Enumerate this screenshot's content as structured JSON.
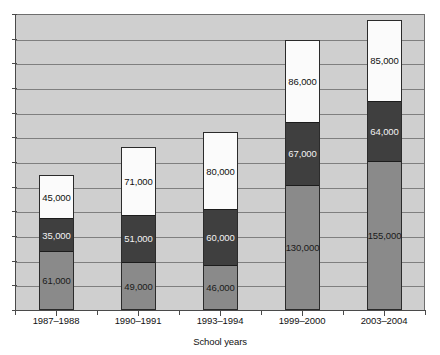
{
  "chart_data": {
    "type": "bar",
    "title": "",
    "xlabel": "School years",
    "ylabel": "",
    "grid": true,
    "legend": "none",
    "stacked": true,
    "categories": [
      "1987–1988",
      "1990–1991",
      "1993–1994",
      "1999–2000",
      "2003–2004"
    ],
    "series": [
      {
        "name": "bottom-segment",
        "color": "#8a8a8a",
        "values": [
          61000,
          49000,
          46000,
          130000,
          155000
        ],
        "labels": [
          "61,000",
          "49,000",
          "46,000",
          "130,000",
          "155,000"
        ]
      },
      {
        "name": "middle-segment",
        "color": "#3f3f3f",
        "values": [
          35000,
          51000,
          60000,
          67000,
          64000
        ],
        "labels": [
          "35,000",
          "51,000",
          "60,000",
          "67,000",
          "64,000"
        ]
      },
      {
        "name": "top-segment",
        "color": "#fbfbfb",
        "values": [
          45000,
          71000,
          80000,
          86000,
          85000
        ],
        "labels": [
          "45,000",
          "71,000",
          "80,000",
          "86,000",
          "85,000"
        ]
      }
    ],
    "totals": [
      141000,
      171000,
      186000,
      283000,
      304000
    ],
    "ylim": [
      0,
      310000
    ],
    "ytick_labels": []
  },
  "axis": {
    "x_title": "School years",
    "tick_labels": [
      "1987–1988",
      "1990–1991",
      "1993–1994",
      "1999–2000",
      "2003–2004"
    ]
  },
  "clipped_title": "",
  "colors": {
    "plot_background": "#cfcfcf",
    "gridline": "#7f7f7f",
    "axis": "#4a4a4a",
    "bar_bottom": "#8a8a8a",
    "bar_middle": "#3f3f3f",
    "bar_top": "#fbfbfb",
    "page_background": "#ffffff"
  },
  "bars": [
    {
      "category": "1987–1988",
      "bottom_label": "61,000",
      "middle_label": "35,000",
      "top_label": "45,000"
    },
    {
      "category": "1990–1991",
      "bottom_label": "49,000",
      "middle_label": "51,000",
      "top_label": "71,000"
    },
    {
      "category": "1993–1994",
      "bottom_label": "46,000",
      "middle_label": "60,000",
      "top_label": "80,000"
    },
    {
      "category": "1999–2000",
      "bottom_label": "130,000",
      "middle_label": "67,000",
      "top_label": "86,000"
    },
    {
      "category": "2003–2004",
      "bottom_label": "155,000",
      "middle_label": "64,000",
      "top_label": "85,000"
    }
  ]
}
